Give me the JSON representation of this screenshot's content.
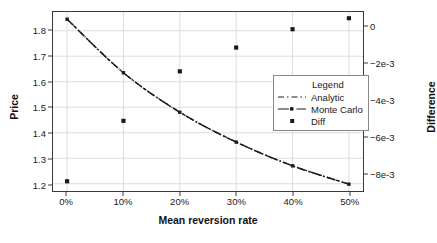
{
  "chart_data": {
    "type": "line",
    "title": "",
    "xlabel": "Mean reversion rate",
    "ylabel": "Price",
    "ylabel_right": "Difference",
    "x": [
      0,
      10,
      20,
      30,
      40,
      50
    ],
    "xtick_labels": [
      "0%",
      "10%",
      "20%",
      "30%",
      "40%",
      "50%"
    ],
    "xlim": [
      -2.5,
      52.5
    ],
    "ylim": [
      1.1715,
      1.8735
    ],
    "ytick_values": [
      1.2,
      1.3,
      1.4,
      1.5,
      1.6,
      1.7,
      1.8
    ],
    "ytick_labels": [
      "1.2",
      "1.3",
      "1.4",
      "1.5",
      "1.6",
      "1.7",
      "1.8"
    ],
    "ylim_right": [
      -0.00898,
      0.00079
    ],
    "ytick_values_right": [
      0,
      -0.002,
      -0.004,
      -0.006,
      -0.008
    ],
    "ytick_labels_right": [
      "0",
      "−2e-3",
      "−4e-3",
      "−6e-3",
      "−8e-3"
    ],
    "grid": true,
    "legend_position": "center-right",
    "series": [
      {
        "name": "Analytic",
        "style": "dashed-line",
        "values": [
          1.8455,
          1.6355,
          1.4805,
          1.3635,
          1.2705,
          1.1985
        ]
      },
      {
        "name": "Monte Carlo",
        "style": "dash-dot-line-with-markers",
        "values": [
          1.8452,
          1.6353,
          1.4803,
          1.3633,
          1.2703,
          1.1983
        ]
      },
      {
        "name": "Diff",
        "style": "square-markers",
        "axis": "right",
        "values": [
          -0.00845,
          -0.00515,
          -0.00245,
          -0.00115,
          -0.00015,
          0.00045
        ]
      }
    ]
  },
  "legend": {
    "title": "Legend",
    "items": [
      {
        "label": "Analytic"
      },
      {
        "label": "Monte Carlo"
      },
      {
        "label": "Diff"
      }
    ]
  },
  "colors": {
    "line": "#1a1a1a",
    "marker": "#1a1a1a",
    "grid": "#d9d9d9",
    "axis": "#3a3a3a",
    "background": "#ffffff"
  }
}
